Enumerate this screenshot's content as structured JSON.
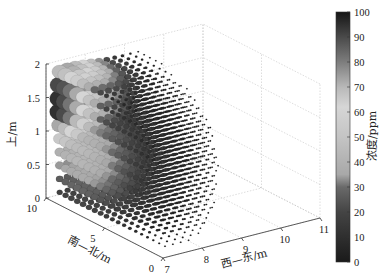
{
  "chart_data": {
    "type": "scatter",
    "subtype": "scatter3",
    "title": "",
    "xlabel": "西—东/m",
    "ylabel": "南—北/m",
    "zlabel": "上/m",
    "xlim": [
      7,
      11
    ],
    "ylim": [
      0,
      10
    ],
    "zlim": [
      0,
      2
    ],
    "xticks": [
      7,
      8,
      9,
      10,
      11
    ],
    "yticks": [
      0,
      5,
      10
    ],
    "zticks": [
      0,
      0.5,
      1,
      1.5,
      2
    ],
    "grid": true,
    "colorbar": {
      "label": "浓度/ppm",
      "range": [
        0,
        100
      ],
      "ticks": [
        0,
        10,
        20,
        30,
        40,
        50,
        60,
        70,
        80,
        90,
        100
      ],
      "placement": "right",
      "colormap_stops": [
        {
          "value": 0,
          "color": "#1a1a1a"
        },
        {
          "value": 20,
          "color": "#444444"
        },
        {
          "value": 30,
          "color": "#6a6a6a"
        },
        {
          "value": 35,
          "color": "#a8a8a8"
        },
        {
          "value": 50,
          "color": "#c4c4c4"
        },
        {
          "value": 62,
          "color": "#d6d6d6"
        },
        {
          "value": 70,
          "color": "#b8b8b8"
        },
        {
          "value": 80,
          "color": "#7d7d7d"
        },
        {
          "value": 90,
          "color": "#4a4a4a"
        },
        {
          "value": 100,
          "color": "#151515"
        }
      ]
    },
    "grid_points": {
      "x_range": [
        7.2,
        10.6
      ],
      "x_step": 0.2,
      "y_range": [
        0.5,
        9.5
      ],
      "y_step": 0.5,
      "z_range": [
        0.1,
        1.9
      ],
      "z_step": 0.2,
      "note": "marker size and color both scale with concentration; highest concentrations concentrated near x≈7.2-8, y≈8-10, z≈1.3-1.7"
    },
    "hotspots": [
      {
        "x": 7.4,
        "y": 9.5,
        "z": 1.6,
        "value": 98
      },
      {
        "x": 7.3,
        "y": 9.8,
        "z": 1.4,
        "value": 100
      },
      {
        "x": 7.2,
        "y": 9.6,
        "z": 1.15,
        "value": 65
      },
      {
        "x": 7.6,
        "y": 9.0,
        "z": 1.7,
        "value": 55
      }
    ]
  }
}
